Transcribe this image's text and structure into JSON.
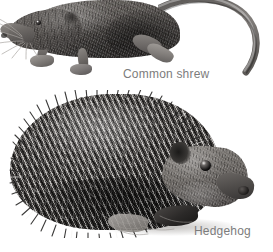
{
  "plate": {
    "kind": "natural-history-illustration-plate",
    "background_color": "#ffffff",
    "width": 273,
    "height": 252,
    "style": "grayscale pencil / engraving",
    "caption_color": "#7c7c7c"
  },
  "figures": [
    {
      "id": "common-shrew",
      "caption": "Common shrew",
      "description": "Small insectivore in side profile facing left, pointed snout, tiny black eye, long whiskers, dense dark brown-grey fur, long arched tail sweeping up and to the right",
      "pose": "side profile facing left",
      "tone_light": "#8e8a86",
      "tone_mid": "#56524f",
      "tone_dark": "#343231",
      "features": [
        "pointed-snout",
        "black-eye",
        "whiskers",
        "small-rounded-ear",
        "clawed-forefoot",
        "clawed-hindfoot",
        "long-arched-tail"
      ]
    },
    {
      "id": "hedgehog",
      "caption": "Hedgehog",
      "description": "Hedgehog in side profile facing right, rounded body densely covered with banded light-and-dark spines, pale furred face with dark eye and ear, pointed dark snout, small feet below with cast shadow",
      "pose": "side profile facing right",
      "tone_light": "#8b8783",
      "tone_mid": "#4a4745",
      "tone_dark": "#2f2d2c",
      "features": [
        "banded-spines",
        "dark-eye",
        "rounded-ear",
        "pointed-snout",
        "dark-nose",
        "forefoot",
        "hindfoot",
        "ground-shadow"
      ]
    }
  ]
}
